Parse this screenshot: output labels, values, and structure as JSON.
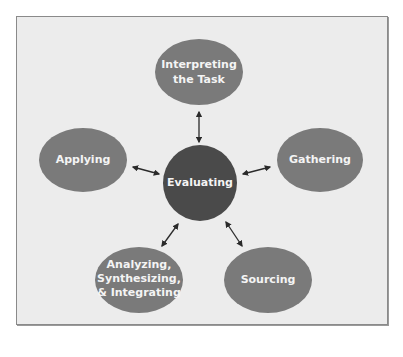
{
  "diagram": {
    "type": "hub-and-spoke cycle",
    "center": {
      "id": "evaluating",
      "label": "Evaluating",
      "color": "#4a4a4a"
    },
    "nodes": [
      {
        "id": "interpreting",
        "lines": [
          "Interpreting",
          "the Task"
        ],
        "color": "#7a7a7a"
      },
      {
        "id": "gathering",
        "lines": [
          "Gathering"
        ],
        "color": "#7a7a7a"
      },
      {
        "id": "sourcing",
        "lines": [
          "Sourcing"
        ],
        "color": "#7a7a7a"
      },
      {
        "id": "analyzing",
        "lines": [
          "Analyzing,",
          "Synthesizing,",
          "& Integrating"
        ],
        "color": "#7a7a7a"
      },
      {
        "id": "applying",
        "lines": [
          "Applying"
        ],
        "color": "#7a7a7a"
      }
    ],
    "edges": [
      {
        "from": "evaluating",
        "to": "interpreting",
        "style": "double-arrow"
      },
      {
        "from": "evaluating",
        "to": "gathering",
        "style": "double-arrow"
      },
      {
        "from": "evaluating",
        "to": "sourcing",
        "style": "double-arrow"
      },
      {
        "from": "evaluating",
        "to": "analyzing",
        "style": "double-arrow"
      },
      {
        "from": "evaluating",
        "to": "applying",
        "style": "double-arrow"
      }
    ],
    "background_color": "#ececec",
    "border_color": "#8a8a8a"
  }
}
